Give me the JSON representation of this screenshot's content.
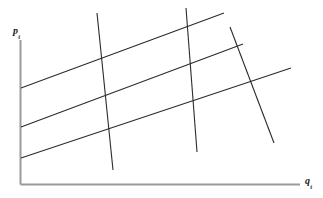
{
  "figure": {
    "title": "",
    "kind": "supply-demand-identification-lattice",
    "width": 323,
    "height": 198,
    "background_color": "#ffffff"
  },
  "axes": {
    "y": {
      "label_base": "p",
      "label_sub": "t",
      "label_full": "p_t",
      "meaning": "price",
      "color": "#9a9a9a",
      "x": 20.5,
      "y_top": 40,
      "y_bottom": 184.5
    },
    "x": {
      "label_base": "q",
      "label_sub": "t",
      "label_full": "q_t",
      "meaning": "quantity",
      "color": "#9a9a9a",
      "y": 184.5,
      "x_left": 20.5,
      "x_right": 300
    }
  },
  "chart_data": {
    "type": "line",
    "title": "",
    "xlabel": "q_t",
    "ylabel": "p_t",
    "grid": false,
    "legend": null,
    "line_color": "#2b2b2b",
    "line_width": 1.1,
    "series": [
      {
        "name": "supply-1",
        "group": "supply",
        "slope_sign": "positive",
        "points": [
          [
            21,
            88
          ],
          [
            224,
            13
          ]
        ]
      },
      {
        "name": "supply-2",
        "group": "supply",
        "slope_sign": "positive",
        "points": [
          [
            21,
            127
          ],
          [
            243,
            44
          ]
        ]
      },
      {
        "name": "supply-3",
        "group": "supply",
        "slope_sign": "positive",
        "points": [
          [
            21,
            158
          ],
          [
            291,
            68
          ]
        ]
      },
      {
        "name": "demand-1",
        "group": "demand",
        "slope_sign": "negative",
        "points": [
          [
            97,
            13
          ],
          [
            113,
            170
          ]
        ]
      },
      {
        "name": "demand-2",
        "group": "demand",
        "slope_sign": "negative",
        "points": [
          [
            186,
            8
          ],
          [
            197,
            152
          ]
        ]
      },
      {
        "name": "demand-3",
        "group": "demand",
        "slope_sign": "negative",
        "points": [
          [
            230,
            27
          ],
          [
            274,
            143
          ]
        ]
      }
    ]
  }
}
